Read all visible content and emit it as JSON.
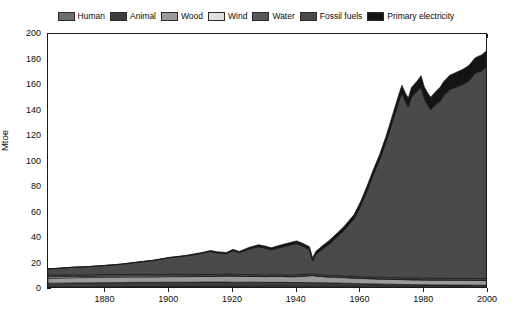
{
  "chart_data": {
    "type": "area",
    "stacked": true,
    "title": "",
    "xlabel": "",
    "ylabel": "Mtoe",
    "xlim": [
      1862,
      2000
    ],
    "ylim": [
      0,
      200
    ],
    "xticks": [
      1880,
      1900,
      1920,
      1940,
      1960,
      1980,
      2000
    ],
    "xtick_labels": [
      "1880",
      "1900",
      "1920",
      "1940",
      "1960",
      "1980",
      "2000"
    ],
    "yticks": [
      0,
      20,
      40,
      60,
      80,
      100,
      120,
      140,
      160,
      180,
      200
    ],
    "ytick_labels": [
      "0",
      "20",
      "40",
      "60",
      "80",
      "100",
      "120",
      "140",
      "160",
      "180",
      "200"
    ],
    "grid": false,
    "legend_position": "top",
    "legend": [
      "Human",
      "Animal",
      "Wood",
      "Wind",
      "Water",
      "Fossil fuels",
      "Primary electricity"
    ],
    "colors": {
      "Human": "#6e6e6e",
      "Animal": "#3d3d3d",
      "Wood": "#9a9a9a",
      "Wind": "#dedede",
      "Water": "#595959",
      "Fossil fuels": "#4a4a4a",
      "Primary electricity": "#141414"
    },
    "x": [
      1862,
      1865,
      1870,
      1875,
      1880,
      1885,
      1890,
      1895,
      1900,
      1905,
      1910,
      1913,
      1915,
      1918,
      1920,
      1922,
      1925,
      1928,
      1930,
      1932,
      1935,
      1938,
      1940,
      1942,
      1944,
      1945,
      1946,
      1948,
      1950,
      1953,
      1955,
      1958,
      1960,
      1962,
      1964,
      1966,
      1968,
      1970,
      1972,
      1973,
      1974,
      1975,
      1976,
      1978,
      1979,
      1980,
      1981,
      1982,
      1984,
      1985,
      1986,
      1988,
      1990,
      1992,
      1994,
      1996,
      1998,
      2000
    ],
    "series": [
      {
        "name": "Human",
        "values": [
          1.6,
          1.6,
          1.7,
          1.7,
          1.8,
          1.8,
          1.9,
          1.9,
          2.0,
          2.0,
          2.1,
          2.1,
          2.1,
          2.1,
          2.1,
          2.1,
          2.2,
          2.2,
          2.2,
          2.2,
          2.2,
          2.2,
          2.2,
          2.2,
          2.2,
          2.2,
          2.2,
          2.2,
          2.2,
          2.2,
          2.2,
          2.2,
          2.2,
          2.2,
          2.2,
          2.2,
          2.2,
          2.2,
          2.2,
          2.2,
          2.2,
          2.2,
          2.2,
          2.2,
          2.2,
          2.2,
          2.2,
          2.2,
          2.2,
          2.2,
          2.2,
          2.2,
          2.2,
          2.2,
          2.2,
          2.2,
          2.2,
          2.2
        ]
      },
      {
        "name": "Animal",
        "values": [
          3.0,
          3.0,
          3.1,
          3.1,
          3.2,
          3.2,
          3.3,
          3.3,
          3.3,
          3.3,
          3.3,
          3.3,
          3.3,
          3.3,
          3.2,
          3.2,
          3.1,
          3.1,
          3.0,
          3.0,
          3.0,
          2.9,
          2.9,
          2.9,
          2.8,
          2.8,
          2.8,
          2.7,
          2.6,
          2.5,
          2.4,
          2.2,
          2.0,
          1.9,
          1.8,
          1.7,
          1.6,
          1.5,
          1.4,
          1.4,
          1.3,
          1.3,
          1.2,
          1.2,
          1.1,
          1.1,
          1.1,
          1.0,
          1.0,
          1.0,
          1.0,
          0.9,
          0.9,
          0.9,
          0.9,
          0.8,
          0.8,
          0.8
        ]
      },
      {
        "name": "Wood",
        "values": [
          4.0,
          4.0,
          4.1,
          4.2,
          4.2,
          4.3,
          4.3,
          4.3,
          4.4,
          4.4,
          4.4,
          4.4,
          4.5,
          4.8,
          4.8,
          4.7,
          4.6,
          4.5,
          4.5,
          4.6,
          4.6,
          4.5,
          4.6,
          5.0,
          5.4,
          5.6,
          5.2,
          4.8,
          4.6,
          4.4,
          4.3,
          4.2,
          4.1,
          4.0,
          4.0,
          3.9,
          3.9,
          3.8,
          3.8,
          3.8,
          3.8,
          3.8,
          3.8,
          3.8,
          3.8,
          3.8,
          3.8,
          3.8,
          3.8,
          3.8,
          3.8,
          3.8,
          3.8,
          3.8,
          3.8,
          3.8,
          3.8,
          3.8
        ]
      },
      {
        "name": "Wind",
        "values": [
          1.0,
          1.0,
          1.0,
          0.9,
          0.9,
          0.8,
          0.8,
          0.7,
          0.6,
          0.5,
          0.4,
          0.4,
          0.3,
          0.3,
          0.3,
          0.2,
          0.2,
          0.2,
          0.2,
          0.2,
          0.2,
          0.2,
          0.2,
          0.2,
          0.2,
          0.2,
          0.2,
          0.2,
          0.2,
          0.2,
          0.2,
          0.2,
          0.2,
          0.2,
          0.2,
          0.2,
          0.2,
          0.2,
          0.2,
          0.2,
          0.2,
          0.2,
          0.2,
          0.2,
          0.2,
          0.2,
          0.2,
          0.2,
          0.2,
          0.2,
          0.2,
          0.2,
          0.2,
          0.2,
          0.2,
          0.2,
          0.2,
          0.2
        ]
      },
      {
        "name": "Water",
        "values": [
          1.2,
          1.2,
          1.2,
          1.2,
          1.2,
          1.2,
          1.2,
          1.2,
          1.2,
          1.2,
          1.2,
          1.2,
          1.2,
          1.2,
          1.2,
          1.2,
          1.2,
          1.2,
          1.2,
          1.2,
          1.2,
          1.2,
          1.2,
          1.2,
          1.2,
          1.2,
          1.2,
          1.2,
          1.2,
          1.2,
          1.2,
          1.2,
          1.2,
          1.2,
          1.2,
          1.2,
          1.2,
          1.2,
          1.2,
          1.2,
          1.2,
          1.2,
          1.2,
          1.2,
          1.2,
          1.2,
          1.2,
          1.2,
          1.2,
          1.2,
          1.2,
          1.2,
          1.2,
          1.2,
          1.2,
          1.2,
          1.2,
          1.2
        ]
      },
      {
        "name": "Fossil fuels",
        "values": [
          5.0,
          5.4,
          6.0,
          6.5,
          7.2,
          8.2,
          9.5,
          11.0,
          13.0,
          14.5,
          16.5,
          18.0,
          17.0,
          16.0,
          18.5,
          17.0,
          20.0,
          22.0,
          21.0,
          19.5,
          21.5,
          23.5,
          24.5,
          22.0,
          19.0,
          10.0,
          15.5,
          20.0,
          24.0,
          31.0,
          36.0,
          45.0,
          55.0,
          67.0,
          80.0,
          92.0,
          106.0,
          122.0,
          138.0,
          145.0,
          139.0,
          134.0,
          142.0,
          147.0,
          150.0,
          141.0,
          136.0,
          132.0,
          137.0,
          139.0,
          143.0,
          148.0,
          150.0,
          152.0,
          155.0,
          161.0,
          163.0,
          167.0
        ]
      },
      {
        "name": "Primary electricity",
        "values": [
          0.0,
          0.0,
          0.0,
          0.0,
          0.0,
          0.0,
          0.1,
          0.2,
          0.3,
          0.4,
          0.6,
          0.8,
          0.8,
          0.9,
          1.0,
          1.1,
          1.3,
          1.5,
          1.6,
          1.6,
          1.8,
          2.0,
          2.1,
          2.2,
          2.3,
          2.3,
          2.4,
          2.6,
          2.8,
          3.0,
          3.2,
          3.4,
          3.6,
          3.8,
          4.0,
          4.2,
          4.5,
          5.0,
          5.6,
          6.0,
          6.5,
          7.0,
          7.5,
          8.2,
          8.8,
          9.2,
          9.6,
          10.0,
          10.5,
          10.8,
          11.0,
          11.3,
          11.6,
          11.8,
          12.0,
          12.2,
          12.4,
          12.6
        ]
      }
    ],
    "annotations": [
      {
        "text": "Sharp dip around 1944-1945 in fossil fuels",
        "x": 1945
      },
      {
        "text": "Rapid growth from 1950 to 1973",
        "x": 1960
      }
    ]
  }
}
